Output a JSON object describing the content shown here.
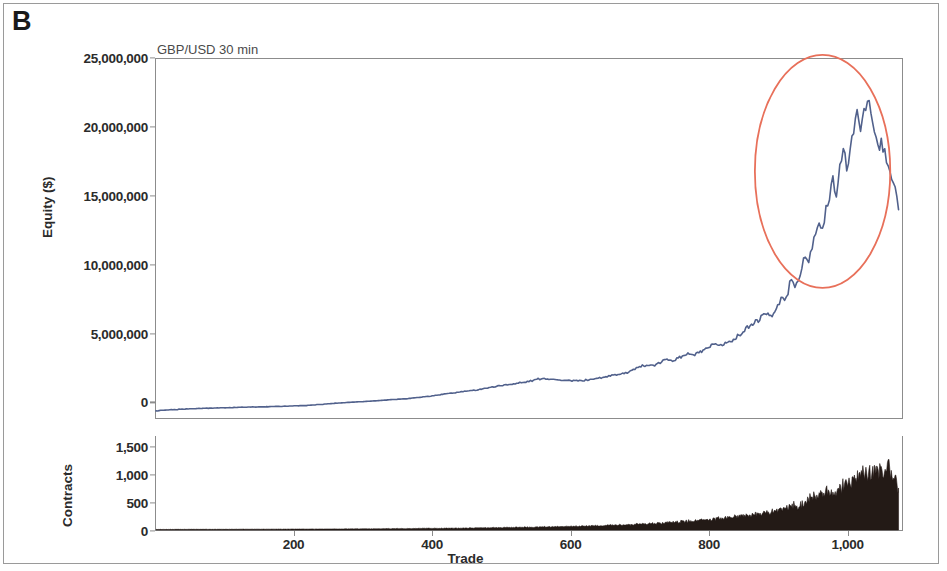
{
  "figure": {
    "panel_letter": "B",
    "chart_title": "GBP/USD 30 min",
    "annotation": "5% fixed fractional MM"
  },
  "colors": {
    "equity_line": "#51618c",
    "contracts_fill": "#231a16",
    "highlight_ellipse": "#e8705a",
    "axis": "#8c8c8c",
    "text": "#2b2b2b",
    "frame": "#9a9a9a"
  },
  "chart_data": [
    {
      "type": "line",
      "name": "equity-curve",
      "title": "GBP/USD 30 min",
      "xlabel": "Trade",
      "ylabel": "Equity ($)",
      "xlim": [
        0,
        1080
      ],
      "ylim": [
        -1200000,
        25000000
      ],
      "xticks": [
        200,
        400,
        600,
        800,
        1000
      ],
      "xtick_labels": [
        "200",
        "400",
        "600",
        "800",
        "1,000"
      ],
      "yticks": [
        0,
        5000000,
        10000000,
        15000000,
        20000000,
        25000000
      ],
      "ytick_labels": [
        "0",
        "5,000,000",
        "10,000,000",
        "15,000,000",
        "20,000,000",
        "25,000,000"
      ],
      "grid": false,
      "legend": "none",
      "annotations": [
        {
          "text": "5% fixed fractional MM",
          "x": 300,
          "y": 11500000
        },
        {
          "type": "ellipse",
          "label": "drawdown-highlight",
          "cx": 965,
          "cy": 16800000,
          "rx": 98,
          "ry": 8500000,
          "color": "#e8705a"
        }
      ],
      "x": [
        0,
        20,
        40,
        60,
        80,
        100,
        120,
        140,
        160,
        180,
        200,
        220,
        240,
        260,
        280,
        300,
        320,
        340,
        360,
        380,
        400,
        420,
        440,
        460,
        480,
        500,
        520,
        540,
        560,
        580,
        600,
        620,
        640,
        660,
        680,
        700,
        710,
        720,
        730,
        740,
        750,
        760,
        770,
        780,
        790,
        800,
        810,
        820,
        830,
        840,
        850,
        860,
        870,
        880,
        890,
        900,
        905,
        910,
        915,
        920,
        925,
        930,
        935,
        940,
        945,
        950,
        955,
        960,
        965,
        970,
        975,
        980,
        985,
        990,
        995,
        1000,
        1005,
        1010,
        1015,
        1020,
        1025,
        1030,
        1035,
        1040,
        1045,
        1050,
        1055,
        1060,
        1065,
        1070,
        1075
      ],
      "y": [
        -700000,
        -600000,
        -550000,
        -500000,
        -480000,
        -450000,
        -420000,
        -400000,
        -380000,
        -350000,
        -320000,
        -280000,
        -200000,
        -120000,
        -60000,
        0,
        60000,
        140000,
        200000,
        300000,
        420000,
        560000,
        700000,
        820000,
        1000000,
        1180000,
        1300000,
        1480000,
        1700000,
        1600000,
        1500000,
        1550000,
        1700000,
        1900000,
        2100000,
        2500000,
        2700000,
        2600000,
        2850000,
        3100000,
        3000000,
        3250000,
        3500000,
        3400000,
        3650000,
        3900000,
        4200000,
        4100000,
        4400000,
        4700000,
        5100000,
        5500000,
        5900000,
        6400000,
        6300000,
        6900000,
        7600000,
        7300000,
        8100000,
        8800000,
        8300000,
        9000000,
        9800000,
        10600000,
        10200000,
        11400000,
        12200000,
        13100000,
        12500000,
        13800000,
        15000000,
        16200000,
        15400000,
        17000000,
        18300000,
        17200000,
        18600000,
        20000000,
        21100000,
        20200000,
        21600000,
        22000000,
        20800000,
        19600000,
        18500000,
        19000000,
        18200000,
        17400000,
        16300000,
        15200000,
        14000000
      ]
    },
    {
      "type": "area",
      "name": "contracts-series",
      "xlabel": "Trade",
      "ylabel": "Contracts",
      "xlim": [
        0,
        1080
      ],
      "ylim": [
        0,
        1700
      ],
      "yticks": [
        0,
        500,
        1000,
        1500
      ],
      "ytick_labels": [
        "0",
        "500",
        "1,000",
        "1,500"
      ],
      "grid": false,
      "legend": "none",
      "x": [
        0,
        40,
        80,
        120,
        160,
        200,
        240,
        280,
        320,
        360,
        400,
        440,
        480,
        520,
        560,
        600,
        620,
        640,
        660,
        680,
        700,
        720,
        740,
        760,
        780,
        800,
        820,
        840,
        860,
        880,
        900,
        910,
        920,
        930,
        940,
        950,
        960,
        970,
        980,
        990,
        1000,
        1010,
        1020,
        1030,
        1040,
        1050,
        1060,
        1070,
        1075
      ],
      "y": [
        10,
        12,
        12,
        14,
        15,
        16,
        18,
        20,
        22,
        26,
        30,
        34,
        40,
        48,
        56,
        66,
        72,
        80,
        88,
        96,
        108,
        120,
        134,
        150,
        168,
        188,
        212,
        240,
        272,
        310,
        360,
        400,
        450,
        430,
        520,
        580,
        640,
        700,
        660,
        780,
        860,
        940,
        1020,
        980,
        1120,
        1060,
        1150,
        900,
        760
      ]
    }
  ],
  "axes": {
    "equity": {
      "title": "Equity ($)",
      "ticks": [
        {
          "label": "25,000,000",
          "value": 25000000
        },
        {
          "label": "20,000,000",
          "value": 20000000
        },
        {
          "label": "15,000,000",
          "value": 15000000
        },
        {
          "label": "10,000,000",
          "value": 10000000
        },
        {
          "label": "5,000,000",
          "value": 5000000
        },
        {
          "label": "0",
          "value": 0
        }
      ]
    },
    "contracts": {
      "title": "Contracts",
      "ticks": [
        {
          "label": "1,500",
          "value": 1500
        },
        {
          "label": "1,000",
          "value": 1000
        },
        {
          "label": "500",
          "value": 500
        },
        {
          "label": "0",
          "value": 0
        }
      ]
    },
    "x": {
      "title": "Trade",
      "ticks": [
        {
          "label": "200",
          "value": 200
        },
        {
          "label": "400",
          "value": 400
        },
        {
          "label": "600",
          "value": 600
        },
        {
          "label": "800",
          "value": 800
        },
        {
          "label": "1,000",
          "value": 1000
        }
      ]
    }
  }
}
